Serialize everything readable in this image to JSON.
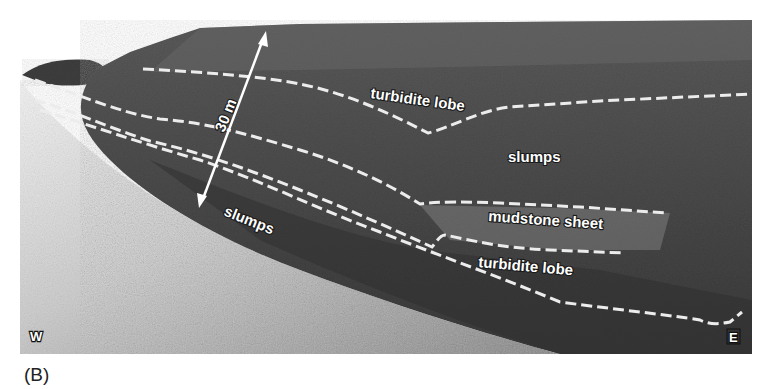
{
  "figure": {
    "panel_label": "(B)",
    "scale_bar": {
      "label": "30 m"
    },
    "orientation": {
      "west": "W",
      "east": "E"
    },
    "unit_labels": {
      "upper_turbidite_lobe": "turbidite lobe",
      "upper_slumps": "slumps",
      "mudstone_sheet": "mudstone sheet",
      "lower_turbidite_lobe": "turbidite lobe",
      "lower_slumps": "slumps"
    },
    "boundary_style": {
      "color": "#e8e8e8",
      "dash": "dashed"
    }
  }
}
